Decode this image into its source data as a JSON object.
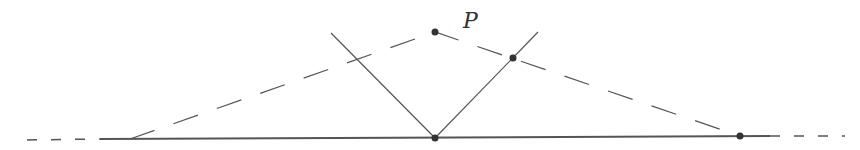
{
  "diagram": {
    "labels": {
      "point_p": "P"
    },
    "colors": {
      "line": "#555555",
      "dot": "#333333",
      "background": "#ffffff"
    },
    "baseline": {
      "solid": [
        [
          100,
          139
        ],
        [
          770,
          136
        ]
      ],
      "dashed_left": [
        [
          27,
          140
        ],
        [
          100,
          139
        ]
      ],
      "dashed_right": [
        [
          770,
          136
        ],
        [
          845,
          136
        ]
      ]
    },
    "dashed_path": [
      [
        130,
        139
      ],
      [
        435,
        32
      ],
      [
        740,
        136
      ]
    ],
    "v_lines": [
      [
        [
          331,
          33
        ],
        [
          435,
          138
        ]
      ],
      [
        [
          435,
          138
        ],
        [
          538,
          32
        ]
      ]
    ],
    "points": [
      {
        "name": "P",
        "x": 435,
        "y": 32
      },
      {
        "name": "intersection",
        "x": 513,
        "y": 58
      },
      {
        "name": "vertex",
        "x": 435,
        "y": 138
      },
      {
        "name": "baseline-point",
        "x": 740,
        "y": 136
      }
    ]
  }
}
